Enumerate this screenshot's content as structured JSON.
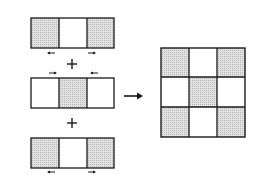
{
  "diagram": {
    "colors": {
      "stroke": "#1a1a1a",
      "shaded": "#d4d4d4",
      "unshaded": "#ffffff",
      "background": "#ffffff"
    },
    "strips": [
      {
        "id": "strip-top",
        "cells": [
          "shaded",
          "white",
          "shaded"
        ],
        "arrows_position": "below",
        "arrows": [
          "left",
          "right"
        ]
      },
      {
        "id": "strip-middle",
        "cells": [
          "white",
          "shaded",
          "white"
        ],
        "arrows_position": "above",
        "arrows": [
          "right",
          "left"
        ]
      },
      {
        "id": "strip-bottom",
        "cells": [
          "shaded",
          "white",
          "shaded"
        ],
        "arrows_position": "below",
        "arrows": [
          "left",
          "right"
        ]
      }
    ],
    "operators": [
      "+",
      "+"
    ],
    "result_arrow": "right",
    "result_grid": [
      [
        "shaded",
        "white",
        "shaded"
      ],
      [
        "white",
        "shaded",
        "white"
      ],
      [
        "shaded",
        "white",
        "shaded"
      ]
    ]
  }
}
